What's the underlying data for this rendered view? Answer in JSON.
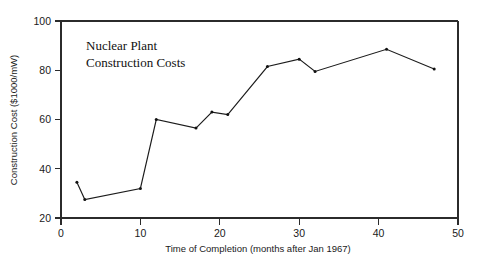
{
  "chart_data": {
    "type": "line",
    "title": "Nuclear Plant Construction Costs",
    "title_line1": "Nuclear Plant",
    "title_line2": "Construction Costs",
    "xlabel": "Time of Completion (months after Jan 1967)",
    "ylabel": "Construction Cost ($1000/mW)",
    "xlim": [
      0,
      50
    ],
    "ylim": [
      20,
      100
    ],
    "xticks": [
      0,
      10,
      20,
      30,
      40,
      50
    ],
    "xtick_labels": [
      "0",
      "10",
      "20",
      "30",
      "40",
      "50"
    ],
    "yticks": [
      20,
      40,
      60,
      80,
      100
    ],
    "ytick_labels": [
      "20",
      "40",
      "60",
      "80",
      "100"
    ],
    "grid": false,
    "legend": null,
    "legend_position": "none",
    "marker": "dot",
    "line_color": "#1c1c1c",
    "series": [
      {
        "name": "Construction Cost",
        "x": [
          2,
          3,
          10,
          12,
          17,
          19,
          21,
          26,
          30,
          32,
          41,
          47
        ],
        "values": [
          34.5,
          27.5,
          32.0,
          60.0,
          56.5,
          63.0,
          62.0,
          81.5,
          84.5,
          79.5,
          88.5,
          80.5
        ]
      }
    ]
  }
}
